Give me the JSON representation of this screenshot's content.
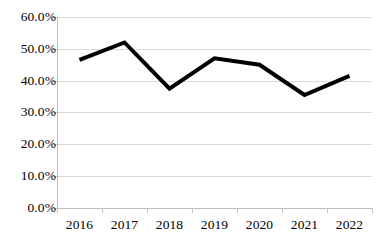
{
  "chart_data": {
    "type": "line",
    "title": "",
    "xlabel": "",
    "ylabel": "",
    "categories": [
      "2016",
      "2017",
      "2018",
      "2019",
      "2020",
      "2021",
      "2022"
    ],
    "values": [
      46.5,
      52.0,
      37.5,
      47.0,
      45.0,
      35.5,
      41.5
    ],
    "series": [
      {
        "name": "",
        "values": [
          46.5,
          52.0,
          37.5,
          47.0,
          45.0,
          35.5,
          41.5
        ],
        "color": "#000000",
        "line_width": 4,
        "markers": false
      }
    ],
    "ylim": [
      0,
      60
    ],
    "y_tick_step": 10,
    "y_tick_labels": [
      "0.0%",
      "10.0%",
      "20.0%",
      "30.0%",
      "40.0%",
      "50.0%",
      "60.0%"
    ],
    "y_tick_values": [
      0,
      10,
      20,
      30,
      40,
      50,
      60
    ],
    "x_tick_labels": [
      "2016",
      "2017",
      "2018",
      "2019",
      "2020",
      "2021",
      "2022"
    ],
    "value_suffix": "%",
    "grid": {
      "horizontal": true,
      "vertical": false,
      "color": "#d9d9d9"
    },
    "legend": {
      "visible": false,
      "position": "none"
    },
    "axis": {
      "line_color": "#bfbfbf",
      "tick_color": "#bfbfbf"
    },
    "plot_background": "#ffffff"
  }
}
